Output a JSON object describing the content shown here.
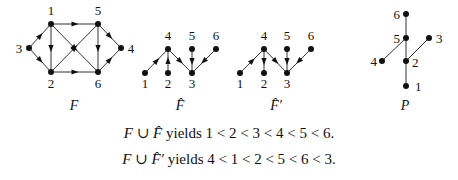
{
  "diagrams": [
    {
      "id": "F",
      "label": "F",
      "directed": true,
      "nodes": [
        {
          "id": "1",
          "x": 51,
          "y": 24,
          "lx": 51,
          "ly": 15,
          "anchor": "middle"
        },
        {
          "id": "2",
          "x": 51,
          "y": 72,
          "lx": 51,
          "ly": 88,
          "anchor": "middle"
        },
        {
          "id": "3",
          "x": 29,
          "y": 48,
          "lx": 19,
          "ly": 53,
          "anchor": "middle"
        },
        {
          "id": "4",
          "x": 121,
          "y": 48,
          "lx": 131,
          "ly": 53,
          "anchor": "middle"
        },
        {
          "id": "5",
          "x": 98,
          "y": 24,
          "lx": 98,
          "ly": 15,
          "anchor": "middle"
        },
        {
          "id": "6",
          "x": 98,
          "y": 72,
          "lx": 98,
          "ly": 88,
          "anchor": "middle"
        }
      ],
      "edges": [
        [
          "3",
          "1"
        ],
        [
          "3",
          "2"
        ],
        [
          "1",
          "2"
        ],
        [
          "1",
          "5"
        ],
        [
          "1",
          "6"
        ],
        [
          "2",
          "5"
        ],
        [
          "2",
          "6"
        ],
        [
          "5",
          "6"
        ],
        [
          "5",
          "4"
        ],
        [
          "6",
          "4"
        ]
      ],
      "caption": {
        "text": "F",
        "x": 74,
        "y": 110
      }
    },
    {
      "id": "Fhat",
      "label": "F̂",
      "directed": true,
      "nodes": [
        {
          "id": "1",
          "x": 145,
          "y": 73,
          "lx": 145,
          "ly": 88,
          "anchor": "middle"
        },
        {
          "id": "2",
          "x": 168,
          "y": 73,
          "lx": 168,
          "ly": 88,
          "anchor": "middle"
        },
        {
          "id": "3",
          "x": 192,
          "y": 73,
          "lx": 192,
          "ly": 88,
          "anchor": "middle"
        },
        {
          "id": "4",
          "x": 168,
          "y": 49,
          "lx": 168,
          "ly": 40,
          "anchor": "middle"
        },
        {
          "id": "5",
          "x": 192,
          "y": 49,
          "lx": 192,
          "ly": 40,
          "anchor": "middle"
        },
        {
          "id": "6",
          "x": 216,
          "y": 49,
          "lx": 216,
          "ly": 40,
          "anchor": "middle"
        }
      ],
      "edges": [
        [
          "1",
          "4"
        ],
        [
          "2",
          "4"
        ],
        [
          "4",
          "3"
        ],
        [
          "5",
          "3"
        ],
        [
          "6",
          "3"
        ]
      ],
      "caption": {
        "text": "F̂",
        "x": 180,
        "y": 110
      }
    },
    {
      "id": "Fhatprime",
      "label": "F̂′",
      "directed": true,
      "nodes": [
        {
          "id": "1",
          "x": 240,
          "y": 73,
          "lx": 240,
          "ly": 88,
          "anchor": "middle"
        },
        {
          "id": "2",
          "x": 264,
          "y": 73,
          "lx": 264,
          "ly": 88,
          "anchor": "middle"
        },
        {
          "id": "3",
          "x": 287,
          "y": 73,
          "lx": 287,
          "ly": 88,
          "anchor": "middle"
        },
        {
          "id": "4",
          "x": 264,
          "y": 49,
          "lx": 264,
          "ly": 40,
          "anchor": "middle"
        },
        {
          "id": "5",
          "x": 287,
          "y": 49,
          "lx": 287,
          "ly": 40,
          "anchor": "middle"
        },
        {
          "id": "6",
          "x": 311,
          "y": 49,
          "lx": 311,
          "ly": 40,
          "anchor": "middle"
        }
      ],
      "edges": [
        [
          "1",
          "4"
        ],
        [
          "4",
          "2"
        ],
        [
          "4",
          "3"
        ],
        [
          "5",
          "3"
        ],
        [
          "6",
          "3"
        ]
      ],
      "caption": {
        "text": "F̂′",
        "x": 276,
        "y": 110
      }
    },
    {
      "id": "P",
      "label": "P",
      "directed": false,
      "nodes": [
        {
          "id": "1",
          "x": 406,
          "y": 86,
          "lx": 415,
          "ly": 91,
          "anchor": "start"
        },
        {
          "id": "2",
          "x": 406,
          "y": 61,
          "lx": 412,
          "ly": 67,
          "anchor": "start"
        },
        {
          "id": "3",
          "x": 429,
          "y": 38,
          "lx": 436,
          "ly": 43,
          "anchor": "start"
        },
        {
          "id": "4",
          "x": 382,
          "y": 61,
          "lx": 377,
          "ly": 66,
          "anchor": "end"
        },
        {
          "id": "5",
          "x": 406,
          "y": 38,
          "lx": 400,
          "ly": 43,
          "anchor": "end"
        },
        {
          "id": "6",
          "x": 406,
          "y": 14,
          "lx": 400,
          "ly": 19,
          "anchor": "end"
        }
      ],
      "edges": [
        [
          "1",
          "2"
        ],
        [
          "2",
          "5"
        ],
        [
          "5",
          "6"
        ],
        [
          "4",
          "5"
        ],
        [
          "2",
          "3"
        ]
      ],
      "caption": {
        "text": "P",
        "x": 405,
        "y": 110
      }
    }
  ],
  "captions": [
    {
      "lhs_a": "F",
      "union": " ∪ ",
      "lhs_b": "F̂",
      "verb": " yields ",
      "order": "1 < 2 < 3 < 4 < 5 < 6."
    },
    {
      "lhs_a": "F",
      "union": " ∪ ",
      "lhs_b": "F̂′",
      "verb": " yields ",
      "order": "4 < 1 < 2 < 5 < 6 < 3."
    }
  ],
  "style": {
    "line_color": "#333333",
    "node_color": "#111111"
  }
}
